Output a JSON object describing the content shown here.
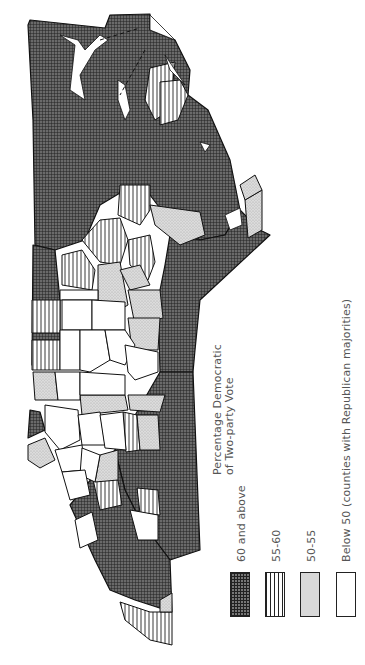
{
  "map": {
    "title": "Percentage Democratic of Two-party Vote",
    "orientation": "rotated 90° counter-clockwise",
    "region": "Virginia counties"
  },
  "legend": {
    "title_line1": "Percentage Democratic",
    "title_line2": "of Two-party Vote",
    "items": [
      {
        "label": "60 and above",
        "pattern": "dense-grid",
        "color": "#555555"
      },
      {
        "label": "55-60",
        "pattern": "vertical-lines",
        "color": "#ffffff"
      },
      {
        "label": "50-55",
        "pattern": "stipple",
        "color": "#d8d8d8"
      },
      {
        "label": "Below 50 (counties with Republican majorities)",
        "pattern": "none",
        "color": "#ffffff"
      }
    ]
  },
  "colors": {
    "border": "#111111",
    "grid_fill": "#5a5a5a",
    "stipple_fill": "#d4d4d4",
    "paper": "#ffffff"
  }
}
